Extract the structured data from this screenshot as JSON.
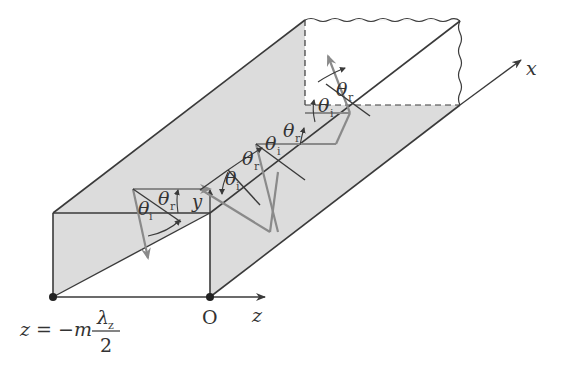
{
  "diagram": {
    "colors": {
      "wall_fill": "#dcdcdc",
      "edge": "#3a3a3a",
      "ray": "#8a8a8a",
      "background": "#ffffff"
    },
    "axes": {
      "x_label": "x",
      "y_label": "y",
      "z_label": "z",
      "origin_label": "O"
    },
    "boundary_label": {
      "lhs": "z = −m",
      "numerator": "λ",
      "numerator_sub": "z",
      "denominator": "2"
    },
    "angles": {
      "theta": "θ",
      "incident_sub": "i",
      "reflected_sub": "r"
    },
    "reflection_points": [
      {
        "label_incident": "θi",
        "label_reflected": "θr"
      },
      {
        "label_incident": "θi",
        "label_reflected": "θr"
      },
      {
        "label_incident": "θi",
        "label_reflected": "θr"
      },
      {
        "label_incident": "θi",
        "label_reflected": "θr"
      }
    ]
  }
}
